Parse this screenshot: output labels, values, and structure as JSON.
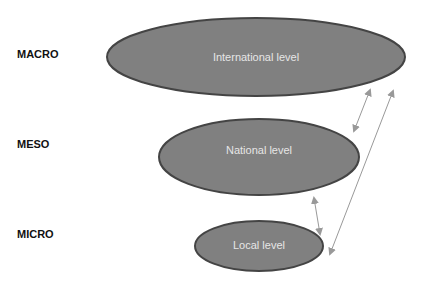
{
  "diagram": {
    "levels": [
      {
        "scale": "MACRO",
        "label": "International level"
      },
      {
        "scale": "MESO",
        "label": "National level"
      },
      {
        "scale": "MICRO",
        "label": "Local level"
      }
    ],
    "colors": {
      "ellipse_fill": "#808080",
      "ellipse_stroke": "#444444",
      "ellipse_text": "#e6e6e6",
      "arrow": "#999999"
    },
    "connections": [
      {
        "from": "International level",
        "to": "National level",
        "type": "bidirectional"
      },
      {
        "from": "National level",
        "to": "Local level",
        "type": "bidirectional"
      },
      {
        "from": "International level",
        "to": "Local level",
        "type": "bidirectional"
      }
    ]
  }
}
